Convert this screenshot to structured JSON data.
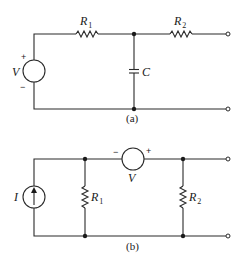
{
  "figure": {
    "circuit_a": {
      "caption": "(a)",
      "source": {
        "label": "V",
        "plus": "+",
        "minus": "−"
      },
      "resistor_1": {
        "label": "R",
        "subscript": "1"
      },
      "resistor_2": {
        "label": "R",
        "subscript": "2"
      },
      "capacitor": {
        "label": "C"
      }
    },
    "circuit_b": {
      "caption": "(b)",
      "current_source": {
        "label": "I"
      },
      "voltage_source": {
        "label": "V",
        "plus": "+",
        "minus": "−"
      },
      "resistor_1": {
        "label": "R",
        "subscript": "1"
      },
      "resistor_2": {
        "label": "R",
        "subscript": "2"
      }
    }
  }
}
